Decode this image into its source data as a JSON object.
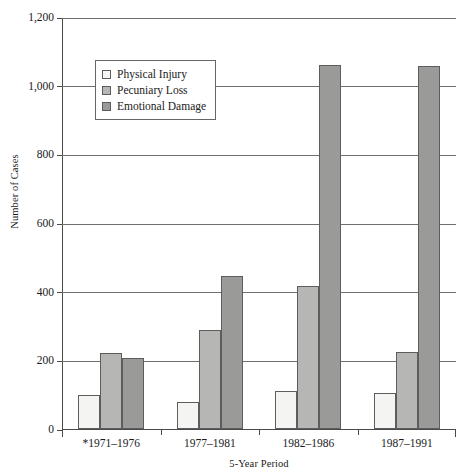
{
  "chart_data": {
    "type": "bar",
    "title": "",
    "xlabel": "5-Year Period",
    "ylabel": "Number of Cases",
    "categories": [
      "*1971–1976",
      "1977–1981",
      "1982–1986",
      "1987–1991"
    ],
    "series": [
      {
        "name": "Physical Injury",
        "values": [
          100,
          80,
          110,
          105
        ],
        "color": "#f4f4f2"
      },
      {
        "name": "Pecuniary Loss",
        "values": [
          222,
          287,
          418,
          225
        ],
        "color": "#b6b6b4"
      },
      {
        "name": "Emotional Damage",
        "values": [
          207,
          445,
          1060,
          1058
        ],
        "color": "#9a9a98"
      }
    ],
    "ylim": [
      0,
      1200
    ],
    "yticks": [
      0,
      200,
      400,
      600,
      800,
      1000,
      1200
    ],
    "ytick_labels": [
      "0",
      "200",
      "400",
      "600",
      "800",
      "1,000",
      "1,200"
    ],
    "grid": true,
    "legend_position": "upper-left-inside"
  }
}
